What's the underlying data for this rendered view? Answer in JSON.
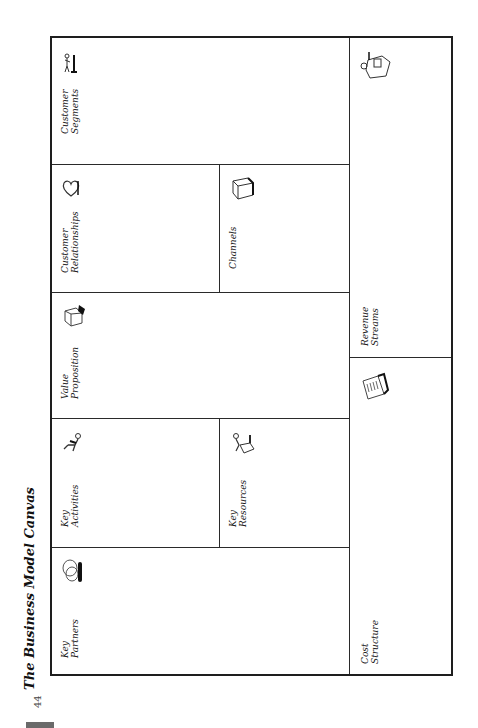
{
  "page": {
    "title": "The Business Model Canvas",
    "page_number": "44"
  },
  "canvas": {
    "cells": {
      "customer_segments": {
        "line1": "Customer",
        "line2": "Segments",
        "icon": "person-at-stand-icon"
      },
      "customer_relationships": {
        "line1": "Customer",
        "line2": "Relationships",
        "icon": "heart-icon"
      },
      "channels": {
        "line1": "Channels",
        "icon": "truck-icon"
      },
      "value_proposition": {
        "line1": "Value",
        "line2": "Proposition",
        "icon": "gift-box-icon"
      },
      "key_activities": {
        "line1": "Key",
        "line2": "Activities",
        "icon": "worker-icon"
      },
      "key_resources": {
        "line1": "Key",
        "line2": "Resources",
        "icon": "person-with-machine-icon"
      },
      "key_partners": {
        "line1": "Key",
        "line2": "Partners",
        "icon": "linked-rings-icon"
      },
      "revenue_streams": {
        "line1": "Revenue",
        "line2": "Streams",
        "icon": "cash-register-icon"
      },
      "cost_structure": {
        "line1": "Cost",
        "line2": "Structure",
        "icon": "price-tag-list-icon"
      }
    }
  }
}
